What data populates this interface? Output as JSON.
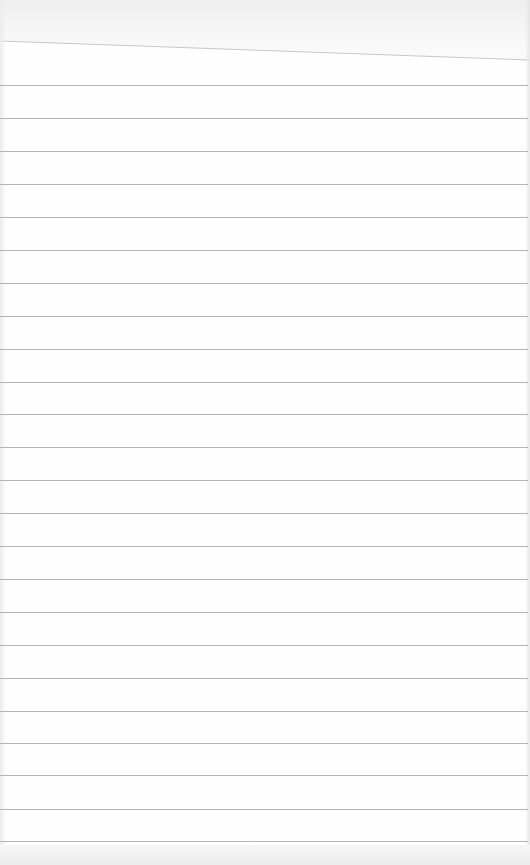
{
  "image": {
    "description": "Photograph of a blank sheet of lined notebook paper",
    "width": 530,
    "height": 865,
    "paper_color": "#fefefe",
    "rule_color": "#a8a8a8",
    "top_band_color": "#eeeeee",
    "bottom_band_color": "#ebebeb",
    "torn_edge": {
      "x1": 0,
      "y1": 41,
      "x2": 530,
      "y2": 60,
      "color": "#c8c8c8"
    },
    "rule_positions_y": [
      85,
      118,
      151,
      184,
      217,
      250,
      283,
      316,
      349,
      382,
      414,
      447,
      480,
      513,
      546,
      579,
      612,
      645,
      678,
      711,
      743,
      775,
      809,
      841
    ],
    "text_content": ""
  }
}
